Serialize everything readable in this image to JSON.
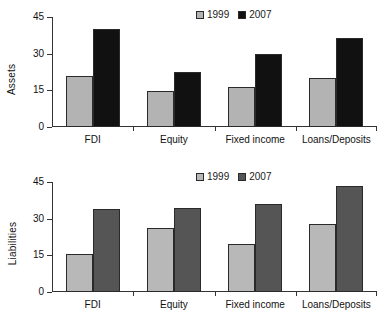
{
  "figure": {
    "background": "#ffffff",
    "panels": [
      {
        "id": "assets",
        "axis_title": "Assets",
        "legend": {
          "items": [
            {
              "label": "1999"
            },
            {
              "label": "2007"
            }
          ]
        },
        "series_colors": {
          "1999": "#b3b3b3",
          "2007": "#111111"
        }
      },
      {
        "id": "liabilities",
        "axis_title": "Liabilities",
        "legend": {
          "items": [
            {
              "label": "1999"
            },
            {
              "label": "2007"
            }
          ]
        },
        "series_colors": {
          "1999": "#b8b8b8",
          "2007": "#555555"
        }
      }
    ]
  },
  "chart_data": [
    {
      "type": "bar",
      "title": "",
      "xlabel": "",
      "ylabel": "Assets",
      "ylim": [
        0,
        45
      ],
      "yticks": [
        0,
        15,
        30,
        45
      ],
      "ytick_labels": [
        "0",
        "15",
        "30",
        "45"
      ],
      "grid": false,
      "legend_position": "top-center",
      "categories": [
        "FDI",
        "Equity",
        "Fixed income",
        "Loans/Deposits"
      ],
      "series": [
        {
          "name": "1999",
          "color": "#b3b3b3",
          "values": [
            21,
            14.8,
            16.5,
            20
          ]
        },
        {
          "name": "2007",
          "color": "#111111",
          "values": [
            40,
            22.5,
            30,
            36.5
          ]
        }
      ]
    },
    {
      "type": "bar",
      "title": "",
      "xlabel": "",
      "ylabel": "Liabilities",
      "ylim": [
        0,
        45
      ],
      "yticks": [
        0,
        15,
        30,
        45
      ],
      "ytick_labels": [
        "0",
        "15",
        "30",
        "45"
      ],
      "grid": false,
      "legend_position": "top-center",
      "categories": [
        "FDI",
        "Equity",
        "Fixed income",
        "Loans/Deposits"
      ],
      "series": [
        {
          "name": "1999",
          "color": "#b8b8b8",
          "values": [
            15.6,
            26.3,
            19.7,
            28
          ]
        },
        {
          "name": "2007",
          "color": "#555555",
          "values": [
            34,
            34.5,
            36,
            43.5
          ]
        }
      ]
    }
  ]
}
